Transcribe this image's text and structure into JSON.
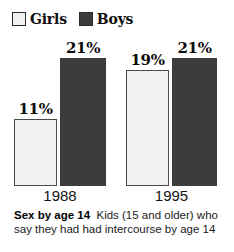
{
  "chart_data": {
    "type": "bar",
    "title": "Sex by age 14",
    "subtitle": "Kids (15 and older) who say they had had intercourse by age 14",
    "categories": [
      "1988",
      "1995"
    ],
    "series": [
      {
        "name": "Girls",
        "color": "#f1f1ef",
        "values": [
          11,
          19
        ],
        "labels": [
          "11%",
          "19%"
        ]
      },
      {
        "name": "Boys",
        "color": "#3c3c3c",
        "values": [
          21,
          21
        ],
        "labels": [
          "21%",
          "21%"
        ]
      }
    ],
    "value_suffix": "%",
    "ylim": [
      0,
      23
    ],
    "xlabel": "",
    "ylabel": "",
    "grid": false,
    "legend_position": "top-left"
  },
  "legend": {
    "items": [
      {
        "label": "Girls",
        "swatch": "light-swatch"
      },
      {
        "label": "Boys",
        "swatch": "dark-swatch"
      }
    ]
  },
  "axis": {
    "categories": [
      "1988",
      "1995"
    ]
  },
  "caption": {
    "title": "Sex by age 14",
    "body": "Kids (15 and older) who say they had had intercourse by age 14"
  }
}
